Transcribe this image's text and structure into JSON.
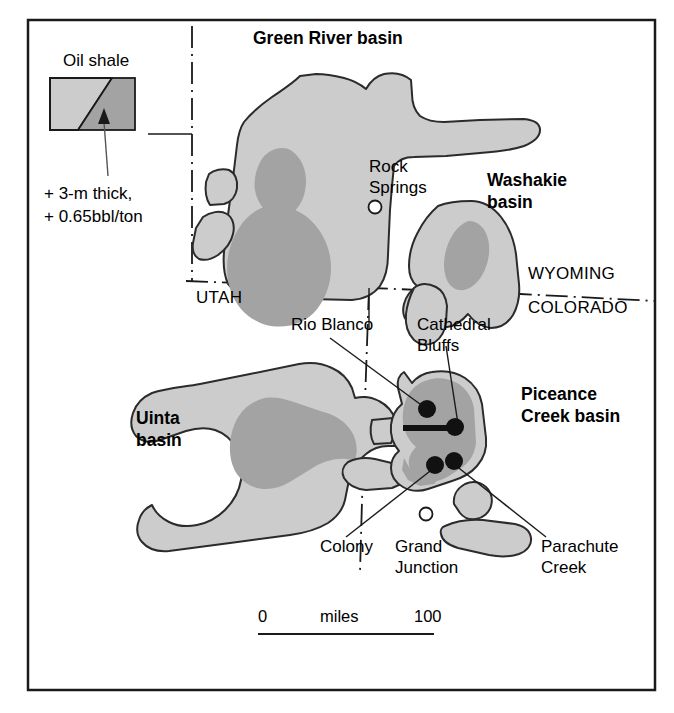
{
  "map": {
    "title_alt": "Oil shale basins of the Green River Formation",
    "frame": {
      "x": 28,
      "y": 20,
      "width": 627,
      "height": 670
    },
    "colors": {
      "shale_light": "#cccccc",
      "shale_dark": "#a3a3a3",
      "outline": "#2b2b2b",
      "frame": "#1a1a1a",
      "background": "#ffffff",
      "marker_filled": "#111111",
      "marker_open_fill": "#ffffff"
    }
  },
  "legend": {
    "title": "Oil shale",
    "note_line1": "+ 3-m thick,",
    "note_line2": "+ 0.65bbl/ton",
    "swatch_light_meaning": "oil shale extent",
    "swatch_dark_meaning": "+ 3-m thick, + 0.65bbl/ton"
  },
  "basins": [
    {
      "id": "green-river",
      "label": "Green River basin",
      "label_x": 253,
      "label_y": 44
    },
    {
      "id": "washakie",
      "label_line1": "Washakie",
      "label_line2": "basin",
      "label_x": 487,
      "label_y": 186
    },
    {
      "id": "piceance-creek",
      "label_line1": "Piceance",
      "label_line2": "Creek basin",
      "label_x": 521,
      "label_y": 400
    },
    {
      "id": "uinta",
      "label_line1": "Uinta",
      "label_line2": "basin",
      "label_x": 136,
      "label_y": 424
    }
  ],
  "states": [
    {
      "name": "UTAH",
      "x": 196,
      "y": 303
    },
    {
      "name": "WYOMING",
      "x": 528,
      "y": 279
    },
    {
      "name": "COLORADO",
      "x": 528,
      "y": 313
    }
  ],
  "cities": [
    {
      "name_line1": "Rock",
      "name_line2": "Springs",
      "label_x": 369,
      "label_y": 172,
      "marker_x": 375,
      "marker_y": 207,
      "marker": "open-circle"
    },
    {
      "name_line1": "Grand",
      "name_line2": "Junction",
      "label_x": 395,
      "label_y": 552,
      "marker_x": 426,
      "marker_y": 514,
      "marker": "open-circle"
    }
  ],
  "sites": [
    {
      "name_line1": "Rio Blanco",
      "name_line2": "",
      "label_x": 291,
      "label_y": 330,
      "marker_x": 427,
      "marker_y": 409,
      "marker": "filled-dot"
    },
    {
      "name_line1": "Cathedral",
      "name_line2": "Bluffs",
      "label_x": 417,
      "label_y": 330,
      "marker_x": 455,
      "marker_y": 427,
      "marker": "filled-dot"
    },
    {
      "name_line1": "Parachute",
      "name_line2": "Creek",
      "label_x": 541,
      "label_y": 552,
      "marker_x": 452,
      "marker_y": 462,
      "marker": "filled-dot"
    },
    {
      "name_line1": "Colony",
      "name_line2": "",
      "label_x": 320,
      "label_y": 552,
      "marker_x": 435,
      "marker_y": 465,
      "marker": "filled-dot"
    }
  ],
  "scale": {
    "min_label": "0",
    "unit_label": "miles",
    "max_label": "100",
    "bar_x1": 258,
    "bar_x2": 432,
    "bar_y": 633,
    "min_x": 258,
    "unit_x": 345,
    "max_x": 430,
    "text_y": 622
  }
}
